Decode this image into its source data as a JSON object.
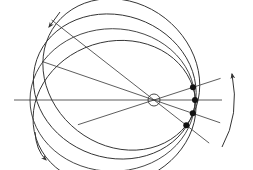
{
  "diagram": {
    "colors": {
      "stroke": "#333333",
      "background": "#ffffff",
      "dot": "#111111"
    },
    "orbits": [
      {
        "name": "orbit-1",
        "rotation_deg": -18
      },
      {
        "name": "orbit-2",
        "rotation_deg": 0
      },
      {
        "name": "orbit-3",
        "rotation_deg": 19
      },
      {
        "name": "orbit-4",
        "rotation_deg": 38
      }
    ],
    "focus_marker": "open-circle",
    "periapsis_markers": "filled-dots",
    "arrows": [
      {
        "name": "precession-arrow-top-left",
        "meaning": "direction indicator"
      },
      {
        "name": "precession-arrow-bottom-left",
        "meaning": "direction indicator"
      },
      {
        "name": "precession-arrow-right",
        "meaning": "rotation of periapsis"
      }
    ]
  }
}
